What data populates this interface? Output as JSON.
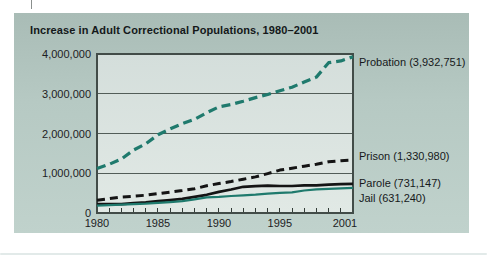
{
  "chart_data": {
    "type": "line",
    "title": "Increase in Adult Correctional Populations, 1980–2001",
    "xlabel": "",
    "ylabel": "",
    "ylim": [
      0,
      4000000
    ],
    "xlim": [
      1980,
      2001
    ],
    "grid": true,
    "legend_position": "labels at right ends of lines",
    "x": [
      1980,
      1981,
      1982,
      1983,
      1984,
      1985,
      1986,
      1987,
      1988,
      1989,
      1990,
      1991,
      1992,
      1993,
      1994,
      1995,
      1996,
      1997,
      1998,
      1999,
      2000,
      2001
    ],
    "yticks": [
      {
        "value": 4000000,
        "label": "4,000,000"
      },
      {
        "value": 3000000,
        "label": "3,000,000"
      },
      {
        "value": 2000000,
        "label": "2,000,000"
      },
      {
        "value": 1000000,
        "label": "1,000,000"
      },
      {
        "value": 0,
        "label": "0"
      }
    ],
    "xticks": [
      {
        "year": 1980,
        "label": "1980"
      },
      {
        "year": 1985,
        "label": "1985"
      },
      {
        "year": 1990,
        "label": "1990"
      },
      {
        "year": 1995,
        "label": "1995"
      },
      {
        "year": 2001,
        "label": "2001"
      }
    ],
    "series": [
      {
        "name": "probation",
        "label": "Probation (3,932,751)",
        "final_value": 3932751,
        "color": "#1f7a6d",
        "style": "dashed",
        "values": [
          1118097,
          1225934,
          1357264,
          1582947,
          1740948,
          1968712,
          2114621,
          2247158,
          2356483,
          2522125,
          2670234,
          2728472,
          2811611,
          2903061,
          2981022,
          3077861,
          3164996,
          3296513,
          3417613,
          3779922,
          3826209,
          3932751
        ]
      },
      {
        "name": "prison",
        "label": "Prison (1,330,980)",
        "final_value": 1330980,
        "color": "#141414",
        "style": "dashed",
        "values": [
          319598,
          360029,
          402914,
          423898,
          448264,
          487593,
          526436,
          562814,
          607766,
          683367,
          743382,
          792535,
          850566,
          909381,
          990147,
          1078542,
          1127528,
          1176564,
          1224469,
          1287172,
          1316333,
          1330980
        ]
      },
      {
        "name": "parole",
        "label": "Parole (731,147)",
        "final_value": 731147,
        "color": "#141414",
        "style": "solid",
        "values": [
          220438,
          225539,
          224604,
          246440,
          266992,
          300203,
          325638,
          355505,
          407977,
          456803,
          531407,
          590442,
          658601,
          676100,
          690371,
          679421,
          679733,
          694787,
          696385,
          714457,
          723898,
          731147
        ]
      },
      {
        "name": "jail",
        "label": "Jail (631,240)",
        "final_value": 631240,
        "color": "#1f7a6d",
        "style": "solid",
        "values": [
          183988,
          196785,
          209582,
          223551,
          234500,
          256615,
          274444,
          295873,
          343569,
          395553,
          405320,
          426479,
          444584,
          459804,
          486474,
          507044,
          518492,
          567079,
          592462,
          605943,
          621149,
          631240
        ]
      }
    ]
  },
  "colors": {
    "panel_top": "#a9bcb6",
    "panel_bottom": "#c0d2cc",
    "plot_top": "#d4dedb",
    "plot_bottom": "#e1e9e5",
    "axis": "#424c48",
    "grid": "#525d58",
    "text": "#1d2123",
    "teal": "#1f7a6d"
  }
}
